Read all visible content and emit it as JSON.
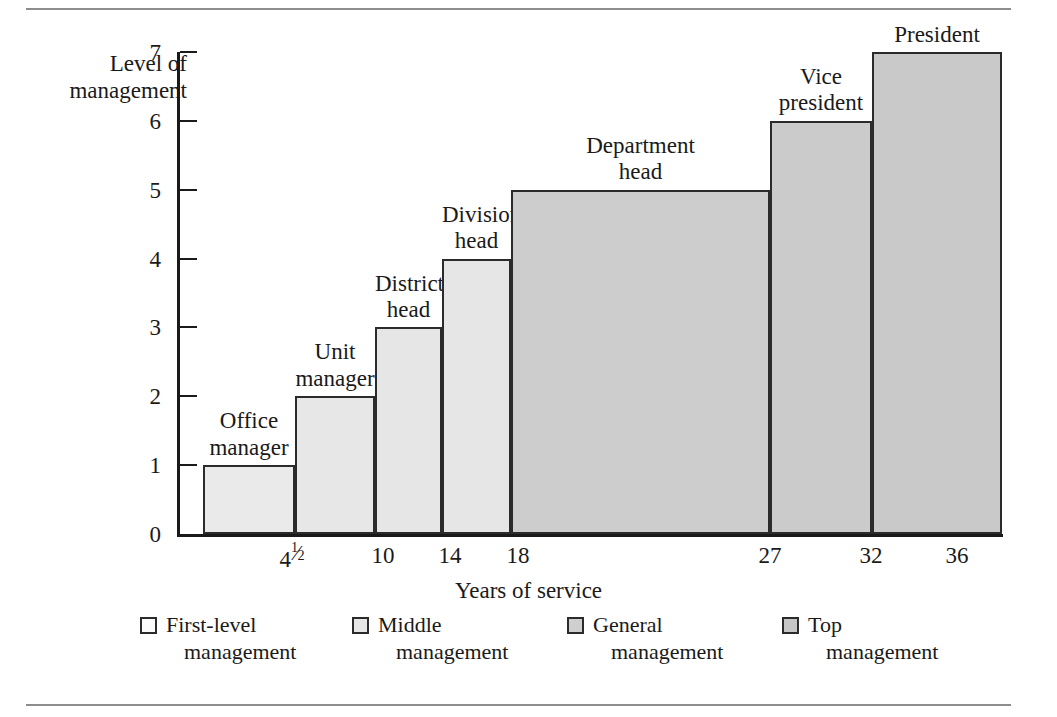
{
  "chart_data": {
    "type": "bar",
    "title": "",
    "xlabel": "Years of service",
    "ylabel": "Level of management",
    "ylabel_line1": "Level of",
    "ylabel_line2": "management",
    "ylim": [
      0,
      7
    ],
    "yticks": [
      0,
      1,
      2,
      3,
      4,
      5,
      6,
      7
    ],
    "grid": false,
    "legend_position": "bottom",
    "categories": [
      "4½",
      "10",
      "14",
      "18",
      "27",
      "32",
      "36"
    ],
    "x_tick_labels": [
      "4 1/2",
      "10",
      "14",
      "18",
      "27",
      "32",
      "36"
    ],
    "values": [
      1,
      2,
      3,
      4,
      5,
      6,
      7
    ],
    "point_labels": [
      "Office manager",
      "Unit manager",
      "District head",
      "Division head",
      "Department head",
      "Vice president",
      "President"
    ],
    "bars": [
      {
        "label_line1": "Office",
        "label_line2": "manager",
        "level": 1,
        "years": "4½",
        "group": "First-level management",
        "color": "#eaeaea"
      },
      {
        "label_line1": "Unit",
        "label_line2": "manager",
        "level": 2,
        "years": "10",
        "group": "Middle management",
        "color": "#e7e7e7"
      },
      {
        "label_line1": "District",
        "label_line2": "head",
        "level": 3,
        "years": "14",
        "group": "Middle management",
        "color": "#e6e6e6"
      },
      {
        "label_line1": "Division",
        "label_line2": "head",
        "level": 4,
        "years": "18",
        "group": "Middle management",
        "color": "#e6e6e6"
      },
      {
        "label_line1": "Department",
        "label_line2": "head",
        "level": 5,
        "years": "27",
        "group": "General management",
        "color": "#cdcdcd"
      },
      {
        "label_line1": "Vice",
        "label_line2": "president",
        "level": 6,
        "years": "32",
        "group": "General management",
        "color": "#cbcbcb"
      },
      {
        "label_line1": "President",
        "label_line2": "",
        "level": 7,
        "years": "36",
        "group": "Top management",
        "color": "#c9c9c9"
      }
    ],
    "legend": [
      {
        "line1": "First-level",
        "line2": "management",
        "color": "#fbfbfb"
      },
      {
        "line1": "Middle",
        "line2": "management",
        "color": "#e6e6e6"
      },
      {
        "line1": "General",
        "line2": "management",
        "color": "#cfcfcf"
      },
      {
        "line1": "Top",
        "line2": "management",
        "color": "#c6c6c6"
      }
    ]
  },
  "axis": {
    "y_title_line1": "Level of",
    "y_title_line2": "management",
    "x_title": "Years of service",
    "y_ticks": [
      "7",
      "6",
      "5",
      "4",
      "3",
      "2",
      "1",
      "0"
    ]
  },
  "colors": {
    "axis": "#1a1a1a",
    "bar_outline": "#2b2b2b",
    "rule": "#8d8d8d",
    "text": "#1a1a1a"
  }
}
